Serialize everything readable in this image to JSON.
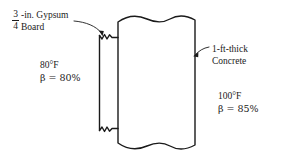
{
  "figure": {
    "type": "engineering-cross-section",
    "background_color": "#ffffff",
    "line_color": "#1a1a1a"
  },
  "gypsum_callout": {
    "fraction_numerator": "3",
    "fraction_denominator": "4",
    "line1": "-in. Gypsum",
    "line2": "Board"
  },
  "concrete_callout": {
    "line1": "1-ft-thick",
    "line2": "Concrete"
  },
  "left_conditions": {
    "temperature": "80°F",
    "beta": "β = 80%"
  },
  "right_conditions": {
    "temperature": "100°F",
    "beta": "β = 85%"
  },
  "layers": [
    {
      "name": "gypsum-board-layer",
      "label": "3/4-in. Gypsum Board",
      "left_x": 99,
      "right_x": 112,
      "fill": "#ffffff",
      "break_lines": [
        "top",
        "bottom"
      ]
    },
    {
      "name": "concrete-layer",
      "label": "1-ft-thick Concrete",
      "left_x": 118,
      "right_x": 195,
      "fill": "#ffffff",
      "break_lines": [
        "top",
        "bottom"
      ]
    }
  ]
}
